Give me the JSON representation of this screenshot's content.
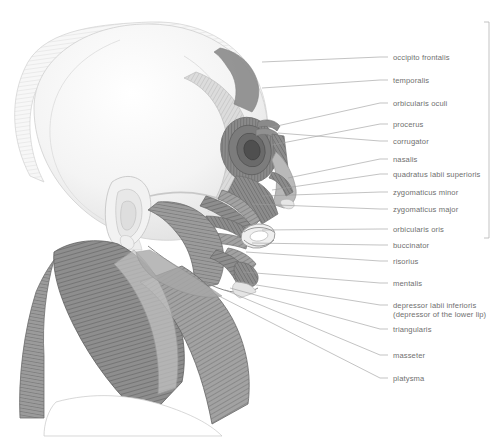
{
  "figure": {
    "view": "lateral left profile",
    "background_color": "#ffffff",
    "label_text_color": "#6f6f6f",
    "leader_line_color": "#9a9a9a",
    "bracket_color": "#b4b4b4"
  },
  "labels": [
    {
      "id": "occipito-frontalis",
      "text": "occipito frontalis",
      "sub": "",
      "label_x": 393,
      "label_y": 53,
      "leader_from_x": 388,
      "leader_from_y": 57,
      "leader_to_x": 262,
      "leader_to_y": 62
    },
    {
      "id": "temporalis",
      "text": "temporalis",
      "sub": "",
      "label_x": 393,
      "label_y": 76,
      "leader_from_x": 388,
      "leader_from_y": 80,
      "leader_to_x": 262,
      "leader_to_y": 88
    },
    {
      "id": "orbicularis-oculi",
      "text": "orbicularis oculi",
      "sub": "",
      "label_x": 393,
      "label_y": 99,
      "leader_from_x": 388,
      "leader_from_y": 103,
      "leader_to_x": 268,
      "leader_to_y": 128
    },
    {
      "id": "procerus",
      "text": "procerus",
      "sub": "",
      "label_x": 393,
      "label_y": 120,
      "leader_from_x": 388,
      "leader_from_y": 124,
      "leader_to_x": 272,
      "leader_to_y": 145
    },
    {
      "id": "corrugator",
      "text": "corrugator",
      "sub": "",
      "label_x": 393,
      "label_y": 137,
      "leader_from_x": 388,
      "leader_from_y": 141,
      "leader_to_x": 278,
      "leader_to_y": 133
    },
    {
      "id": "nasalis",
      "text": "nasalis",
      "sub": "",
      "label_x": 393,
      "label_y": 155,
      "leader_from_x": 388,
      "leader_from_y": 159,
      "leader_to_x": 288,
      "leader_to_y": 178
    },
    {
      "id": "quadratus-labii-superioris",
      "text": "quadratus labii superioris",
      "sub": "",
      "label_x": 393,
      "label_y": 170,
      "leader_from_x": 388,
      "leader_from_y": 174,
      "leader_to_x": 272,
      "leader_to_y": 190
    },
    {
      "id": "zygomaticus-minor",
      "text": "zygomaticus minor",
      "sub": "",
      "label_x": 393,
      "label_y": 188,
      "leader_from_x": 388,
      "leader_from_y": 192,
      "leader_to_x": 262,
      "leader_to_y": 196
    },
    {
      "id": "zygomaticus-major",
      "text": "zygomaticus major",
      "sub": "",
      "label_x": 393,
      "label_y": 205,
      "leader_from_x": 388,
      "leader_from_y": 209,
      "leader_to_x": 252,
      "leader_to_y": 204
    },
    {
      "id": "orbicularis-oris",
      "text": "orbicularis oris",
      "sub": "",
      "label_x": 393,
      "label_y": 225,
      "leader_from_x": 388,
      "leader_from_y": 229,
      "leader_to_x": 262,
      "leader_to_y": 230
    },
    {
      "id": "buccinator",
      "text": "buccinator",
      "sub": "",
      "label_x": 393,
      "label_y": 241,
      "leader_from_x": 388,
      "leader_from_y": 245,
      "leader_to_x": 252,
      "leader_to_y": 243
    },
    {
      "id": "risorius",
      "text": "risorius",
      "sub": "",
      "label_x": 393,
      "label_y": 257,
      "leader_from_x": 388,
      "leader_from_y": 261,
      "leader_to_x": 246,
      "leader_to_y": 252
    },
    {
      "id": "mentalis",
      "text": "mentalis",
      "sub": "",
      "label_x": 393,
      "label_y": 279,
      "leader_from_x": 388,
      "leader_from_y": 283,
      "leader_to_x": 243,
      "leader_to_y": 272
    },
    {
      "id": "depressor-labii-inferioris",
      "text": "depressor labii inferioris",
      "sub": "(depressor of the lower lip)",
      "label_x": 393,
      "label_y": 301,
      "leader_from_x": 388,
      "leader_from_y": 305,
      "leader_to_x": 238,
      "leader_to_y": 282
    },
    {
      "id": "triangularis",
      "text": "triangularis",
      "sub": "",
      "label_x": 393,
      "label_y": 325,
      "leader_from_x": 388,
      "leader_from_y": 329,
      "leader_to_x": 230,
      "leader_to_y": 288
    },
    {
      "id": "masseter",
      "text": "masseter",
      "sub": "",
      "label_x": 393,
      "label_y": 351,
      "leader_from_x": 388,
      "leader_from_y": 355,
      "leader_to_x": 225,
      "leader_to_y": 290
    },
    {
      "id": "platysma",
      "text": "platysma",
      "sub": "",
      "label_x": 393,
      "label_y": 374,
      "leader_from_x": 388,
      "leader_from_y": 378,
      "leader_to_x": 215,
      "leader_to_y": 294
    }
  ],
  "bracket": {
    "x": 489,
    "y_top": 22,
    "y_bottom": 238,
    "tick_length": 5
  }
}
